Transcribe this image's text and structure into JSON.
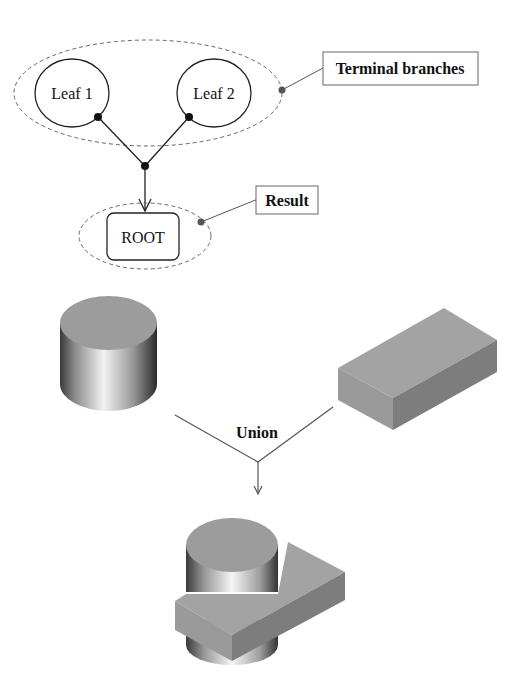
{
  "tree": {
    "leaves": [
      {
        "label": "Leaf 1"
      },
      {
        "label": "Leaf 2"
      }
    ],
    "root": {
      "label": "ROOT"
    },
    "callouts": {
      "terminal": "Terminal branches",
      "result": "Result"
    }
  },
  "operation": {
    "label": "Union",
    "inputs": [
      "cylinder",
      "box"
    ],
    "output": "cylinder-box-union"
  },
  "colors": {
    "line": "#222222",
    "dashed": "#666666",
    "solid_gray": "#9a9a9a",
    "dark_gray": "#7d7d7d",
    "callout_dot": "#555555"
  }
}
